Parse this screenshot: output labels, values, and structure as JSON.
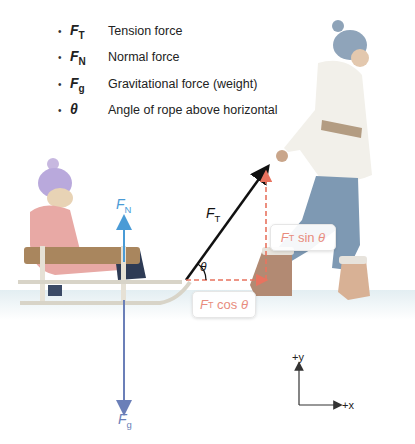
{
  "legend": {
    "items": [
      {
        "symbol": "F",
        "subscript": "T",
        "description": "Tension force"
      },
      {
        "symbol": "F",
        "subscript": "N",
        "description": "Normal force"
      },
      {
        "symbol": "F",
        "subscript": "g",
        "description": "Gravitational force (weight)"
      },
      {
        "symbol": "θ",
        "subscript": "",
        "description": "Angle of rope above horizontal"
      }
    ],
    "bullet": "•"
  },
  "vectors": {
    "normal": {
      "symbol": "F",
      "subscript": "N",
      "color": "#4a9bd6"
    },
    "gravity": {
      "symbol": "F",
      "subscript": "g",
      "color": "#6b7fb8"
    },
    "tension": {
      "symbol": "F",
      "subscript": "T",
      "color": "#111111"
    },
    "angle": {
      "symbol": "θ"
    },
    "horizontal_component": {
      "prefix": "F",
      "subscript": "T",
      "suffix": " cos ",
      "angle": "θ",
      "color": "#e88c7d"
    },
    "vertical_component": {
      "prefix": "F",
      "subscript": "T",
      "suffix": " sin ",
      "angle": "θ",
      "color": "#e88c7d"
    }
  },
  "axes": {
    "y_label": "+y",
    "x_label": "+x"
  },
  "scene": {
    "child_on_sled": "child-on-sled",
    "adult_pulling": "adult-pulling-rope"
  }
}
